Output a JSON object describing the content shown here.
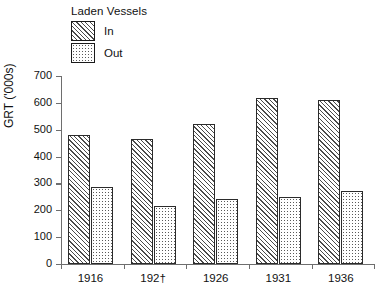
{
  "chart_data": {
    "type": "bar",
    "title": "",
    "xlabel": "",
    "ylabel": "GRT ('000s)",
    "categories": [
      "1916",
      "192†",
      "1926",
      "1931",
      "1936"
    ],
    "series": [
      {
        "name": "In",
        "values": [
          480,
          465,
          522,
          617,
          610
        ]
      },
      {
        "name": "Out",
        "values": [
          285,
          217,
          242,
          249,
          271
        ]
      }
    ],
    "ylim": [
      0,
      700
    ],
    "ytick_values": [
      0,
      100,
      200,
      300,
      400,
      500,
      600,
      700
    ],
    "ytick_labels": [
      "0",
      "100",
      "200",
      "300",
      "400",
      "500",
      "600",
      "700"
    ],
    "grid": false,
    "legend": {
      "title": "Laden Vessels",
      "position": "upper-left-inside",
      "entries": [
        {
          "label": "In",
          "pattern": "diagonal-hatch"
        },
        {
          "label": "Out",
          "pattern": "dotted"
        }
      ]
    },
    "colors": {
      "axis": "#6e6e6e",
      "bar_outline": "#2b2b2b",
      "hatch": "#4a4a4a",
      "dots": "#5a5a5a",
      "background": "#ffffff",
      "text": "#111111"
    }
  }
}
